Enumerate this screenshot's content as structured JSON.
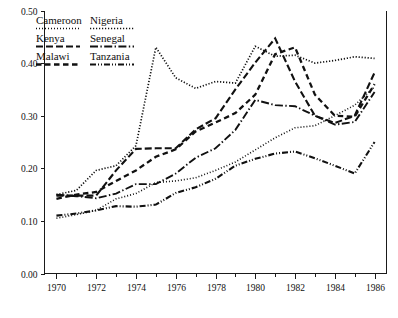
{
  "chart_data": {
    "type": "line",
    "title": "",
    "subtitle": "",
    "xlabel": "",
    "ylabel": "",
    "xlim": [
      1969.4,
      1986.6
    ],
    "ylim": [
      0.0,
      0.5
    ],
    "grid": false,
    "legend_position": "top-left",
    "x": [
      1970,
      1971,
      1972,
      1973,
      1974,
      1975,
      1976,
      1977,
      1978,
      1979,
      1980,
      1981,
      1982,
      1983,
      1984,
      1985,
      1986
    ],
    "xticks": [
      1970,
      1972,
      1974,
      1976,
      1978,
      1980,
      1982,
      1984,
      1986
    ],
    "xticklabels": [
      "1970",
      "1972",
      "1974",
      "1976",
      "1978",
      "1980",
      "1982",
      "1984",
      "1986"
    ],
    "xminorticks": [
      1971,
      1973,
      1975,
      1977,
      1979,
      1981,
      1983,
      1985
    ],
    "yticks": [
      0.0,
      0.1,
      0.2,
      0.3,
      0.4,
      0.5
    ],
    "yticklabels": [
      "0.00",
      "0.10",
      "0.20",
      "0.30",
      "0.40",
      "0.50"
    ],
    "series": [
      {
        "name": "Cameroon",
        "dash_style": "dotted",
        "dasharray": "1,2",
        "width": 1.6,
        "values": [
          0.105,
          0.112,
          0.12,
          0.142,
          0.152,
          0.173,
          0.176,
          0.182,
          0.196,
          0.212,
          0.235,
          0.258,
          0.277,
          0.281,
          0.3,
          0.32,
          0.355
        ]
      },
      {
        "name": "Nigeria",
        "dash_style": "fine-dotted",
        "dasharray": "1.2,1.8",
        "width": 1.7,
        "values": [
          0.15,
          0.158,
          0.196,
          0.205,
          0.243,
          0.43,
          0.372,
          0.352,
          0.365,
          0.362,
          0.432,
          0.413,
          0.415,
          0.4,
          0.405,
          0.412,
          0.409
        ]
      },
      {
        "name": "Kenya",
        "dash_style": "dashed",
        "dasharray": "7,3",
        "width": 2.1,
        "values": [
          0.148,
          0.148,
          0.148,
          0.196,
          0.237,
          0.238,
          0.238,
          0.274,
          0.295,
          0.35,
          0.401,
          0.447,
          0.365,
          0.3,
          0.286,
          0.3,
          0.382
        ]
      },
      {
        "name": "Senegal",
        "dash_style": "dash-dot",
        "dasharray": "8,2.4,1.4,2.4",
        "width": 1.9,
        "values": [
          0.15,
          0.147,
          0.143,
          0.152,
          0.17,
          0.17,
          0.19,
          0.22,
          0.238,
          0.273,
          0.33,
          0.32,
          0.318,
          0.3,
          0.283,
          0.288,
          0.345
        ]
      },
      {
        "name": "Malawi",
        "dash_style": "long-dash",
        "dasharray": "5.5,3.5",
        "width": 2.3,
        "values": [
          0.142,
          0.15,
          0.155,
          0.176,
          0.196,
          0.222,
          0.236,
          0.27,
          0.287,
          0.305,
          0.34,
          0.417,
          0.43,
          0.34,
          0.3,
          0.298,
          0.36
        ]
      },
      {
        "name": "Tanzania",
        "dash_style": "dash-dot-dot",
        "dasharray": "6,2,1,2,1,2",
        "width": 2.1,
        "values": [
          0.11,
          0.114,
          0.12,
          0.128,
          0.127,
          0.131,
          0.153,
          0.164,
          0.18,
          0.205,
          0.218,
          0.228,
          0.232,
          0.219,
          0.205,
          0.19,
          0.25
        ]
      }
    ]
  },
  "legend": {
    "entries": [
      {
        "label": "Cameroon",
        "column": 0,
        "row": 0
      },
      {
        "label": "Nigeria",
        "column": 1,
        "row": 0
      },
      {
        "label": "Kenya",
        "column": 0,
        "row": 1
      },
      {
        "label": "Senegal",
        "column": 1,
        "row": 1
      },
      {
        "label": "Malawi",
        "column": 0,
        "row": 2
      },
      {
        "label": "Tanzania",
        "column": 1,
        "row": 2
      }
    ]
  },
  "colors": {
    "ink": "#111111",
    "background": "#ffffff",
    "axis": "#1a1a1a"
  }
}
